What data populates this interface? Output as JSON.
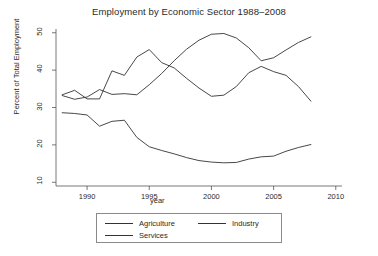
{
  "chart_data": {
    "type": "line",
    "title": "Employment by Economic Sector 1988–2008",
    "xlabel": "year",
    "ylabel": "Percent of Total Employment",
    "xlim": [
      1987.5,
      2010.5
    ],
    "ylim": [
      9,
      51
    ],
    "xticks": [
      1990,
      1995,
      2000,
      2005,
      2010
    ],
    "yticks": [
      10,
      20,
      30,
      40,
      50
    ],
    "grid": false,
    "legend_position": "below-axes",
    "x": [
      1988,
      1989,
      1990,
      1991,
      1992,
      1993,
      1994,
      1995,
      1996,
      1997,
      1998,
      1999,
      2000,
      2001,
      2002,
      2003,
      2004,
      2005,
      2006,
      2007,
      2008
    ],
    "series": [
      {
        "name": "Agriculture",
        "color": "#333333",
        "values": [
          28.6,
          28.4,
          28.0,
          25.0,
          26.3,
          26.6,
          22.0,
          19.5,
          18.5,
          17.6,
          16.6,
          15.8,
          15.4,
          15.2,
          15.3,
          16.2,
          16.8,
          17.0,
          18.3,
          19.3,
          20.1
        ]
      },
      {
        "name": "Industry",
        "color": "#333333",
        "values": [
          33.4,
          34.6,
          32.3,
          32.3,
          39.8,
          38.6,
          43.5,
          45.5,
          42.0,
          40.6,
          37.8,
          35.2,
          33.0,
          33.3,
          35.6,
          39.3,
          41.0,
          39.6,
          38.6,
          35.6,
          31.7
        ]
      },
      {
        "name": "Services",
        "color": "#333333",
        "values": [
          33.2,
          32.2,
          32.8,
          34.8,
          33.5,
          33.7,
          33.4,
          36.1,
          39.1,
          42.5,
          45.6,
          48.0,
          49.6,
          49.8,
          48.6,
          46.0,
          42.5,
          43.3,
          45.4,
          47.4,
          48.9
        ]
      }
    ]
  },
  "legend": {
    "agriculture": "Agriculture",
    "industry": "Industry",
    "services": "Services"
  }
}
